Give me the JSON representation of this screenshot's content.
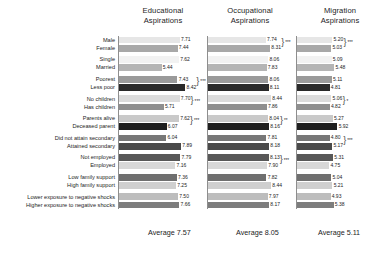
{
  "columns": [
    {
      "id": "educational",
      "title_line1": "Educational",
      "title_line2": "Aspirations",
      "average_label": "Average 7.57",
      "average": 7.57
    },
    {
      "id": "occupational",
      "title_line1": "Occupational",
      "title_line2": "Aspirations",
      "average_label": "Average 8.05",
      "average": 8.05
    },
    {
      "id": "migration",
      "title_line1": "Migration",
      "title_line2": "Aspirations",
      "average_label": "Average 5.11",
      "average": 5.11
    }
  ],
  "categories": [
    "Male",
    "Female",
    "Single",
    "Married",
    "Poorest",
    "Less poor",
    "No children",
    "Has children",
    "Parents alive",
    "Deceased parent",
    "Did not attain secondary",
    "Attained secondary",
    "Not employed",
    "Employed",
    "Low family support",
    "High family support",
    "Lower exposure to negative shocks",
    "Higher exposure to negative shocks"
  ],
  "labels": {
    "educational": [
      "7.71",
      "7.44",
      "7.62",
      "5.44",
      "7.43",
      "8.42",
      "7.70",
      "5.71",
      "7.62",
      "6.07",
      "6.04",
      "7.89",
      "7.79",
      "7.16",
      "7.36",
      "7.25",
      "7.50",
      "7.66"
    ],
    "occupational": [
      "7.74",
      "8.31",
      "8.06",
      "7.83",
      "8.06",
      "8.11",
      "8.44",
      "7.86",
      "8.04",
      "8.16",
      "7.81",
      "8.18",
      "8.13",
      "7.90",
      "7.82",
      "8.44",
      "7.97",
      "8.17"
    ],
    "migration": [
      "5.20",
      "5.03",
      "5.09",
      "5.48",
      "5.11",
      "4.81",
      "5.06",
      "4.82",
      "5.27",
      "5.92",
      "4.80",
      "5.17",
      "5.31",
      "4.75",
      "5.04",
      "5.21",
      "4.93",
      "5.38"
    ]
  },
  "significance": {
    "educational": [
      "",
      "",
      "***",
      "***",
      "***",
      "",
      "",
      ""
    ],
    "occupational": [
      "***",
      "",
      "",
      "",
      "**",
      "",
      "***",
      ""
    ],
    "migration": [
      "***",
      "",
      "",
      "*",
      "",
      "***",
      "",
      ""
    ]
  },
  "chart_data": {
    "type": "bar",
    "title": "",
    "orientation": "horizontal",
    "grid": false,
    "legend": false,
    "xlim": [
      0,
      10
    ],
    "xlabel": "",
    "ylabel": "",
    "categories": [
      "Male",
      "Female",
      "Single",
      "Married",
      "Poorest",
      "Less poor",
      "No children",
      "Has children",
      "Parents alive",
      "Deceased parent",
      "Did not attain secondary",
      "Attained secondary",
      "Not employed",
      "Employed",
      "Low family support",
      "High family support",
      "Lower exposure to negative shocks",
      "Higher exposure to negative shocks"
    ],
    "pairs": [
      [
        "Male",
        "Female"
      ],
      [
        "Single",
        "Married"
      ],
      [
        "Poorest",
        "Less poor"
      ],
      [
        "No children",
        "Has children"
      ],
      [
        "Parents alive",
        "Deceased parent"
      ],
      [
        "Did not attain secondary",
        "Attained secondary"
      ],
      [
        "Not employed",
        "Employed"
      ],
      [
        "Low family support",
        "High family support"
      ],
      [
        "Lower exposure to negative shocks",
        "Higher exposure to negative shocks"
      ]
    ],
    "series": [
      {
        "name": "Educational Aspirations",
        "average": 7.57,
        "values": [
          7.71,
          7.44,
          7.62,
          5.44,
          7.43,
          8.42,
          7.7,
          5.71,
          7.62,
          6.07,
          6.04,
          7.89,
          7.79,
          7.16,
          7.36,
          7.25,
          7.5,
          7.66
        ]
      },
      {
        "name": "Occupational Aspirations",
        "average": 8.05,
        "values": [
          7.74,
          8.31,
          8.06,
          7.83,
          8.06,
          8.11,
          8.44,
          7.86,
          8.04,
          8.16,
          7.81,
          8.18,
          8.13,
          7.9,
          7.82,
          8.44,
          7.97,
          8.17
        ]
      },
      {
        "name": "Migration Aspirations",
        "average": 5.11,
        "values": [
          5.2,
          5.03,
          5.09,
          5.48,
          5.11,
          4.81,
          5.06,
          4.82,
          5.27,
          5.92,
          4.8,
          5.17,
          5.31,
          4.75,
          5.04,
          5.21,
          4.93,
          5.38
        ]
      }
    ],
    "bar_colors": [
      "#e6e6e6",
      "#a8a8a8",
      "#f2f2f2",
      "#b5b5b5",
      "#9a9a9a",
      "#2a2a2a",
      "#dcdcdc",
      "#8f8f8f",
      "#c9c9c9",
      "#1f1f1f",
      "#777777",
      "#4a4a4a",
      "#585858",
      "#d8d8d8",
      "#6f6f6f",
      "#cfcfcf",
      "#bdbdbd",
      "#7d7d7d"
    ]
  }
}
